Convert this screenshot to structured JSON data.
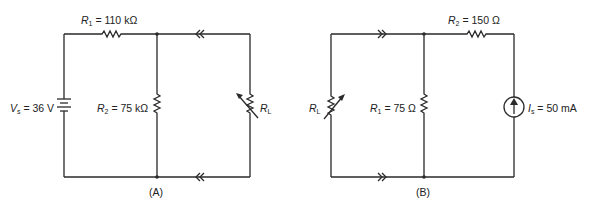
{
  "circuit_a": {
    "caption": "(A)",
    "r1": {
      "symbol": "R",
      "sub": "1",
      "value": "= 110 kΩ"
    },
    "r2": {
      "symbol": "R",
      "sub": "2",
      "value": "= 75 kΩ"
    },
    "source": {
      "symbol": "V",
      "sub": "s",
      "value": "= 36 V",
      "type": "voltage-source"
    },
    "load": {
      "symbol": "R",
      "sub": "L",
      "type": "variable-resistor"
    },
    "current_arrows": "leftward (double chevron) on top and bottom wires"
  },
  "circuit_b": {
    "caption": "(B)",
    "r1": {
      "symbol": "R",
      "sub": "1",
      "value": "= 75 Ω"
    },
    "r2": {
      "symbol": "R",
      "sub": "2",
      "value": "= 150 Ω"
    },
    "source": {
      "symbol": "I",
      "sub": "s",
      "value": "= 50 mA",
      "type": "current-source"
    },
    "load": {
      "symbol": "R",
      "sub": "L",
      "type": "variable-resistor"
    },
    "current_arrows": "rightward (double chevron) on top and bottom wires"
  },
  "colors": {
    "wire": "#2a2a2a",
    "background": "#ffffff"
  }
}
